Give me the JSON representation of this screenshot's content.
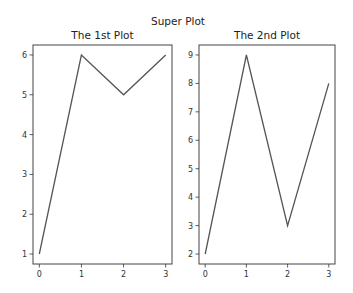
{
  "figure": {
    "suptitle": "Super Plot",
    "line_color": "#555555",
    "frame_color": "#444444"
  },
  "chart_data": [
    {
      "type": "line",
      "title": "The 1st Plot",
      "xlabel": "",
      "ylabel": "",
      "x": [
        0,
        1,
        2,
        3
      ],
      "values": [
        1,
        6,
        5,
        6
      ],
      "xticks": [
        "0",
        "1",
        "2",
        "3"
      ],
      "yticks": [
        "1",
        "2",
        "3",
        "4",
        "5",
        "6"
      ],
      "xlim": [
        -0.15,
        3.15
      ],
      "ylim": [
        0.75,
        6.25
      ],
      "grid": false,
      "legend": null
    },
    {
      "type": "line",
      "title": "The 2nd Plot",
      "xlabel": "",
      "ylabel": "",
      "x": [
        0,
        1,
        2,
        3
      ],
      "values": [
        2,
        9,
        3,
        8
      ],
      "xticks": [
        "0",
        "1",
        "2",
        "3"
      ],
      "yticks": [
        "2",
        "3",
        "4",
        "5",
        "6",
        "7",
        "8",
        "9"
      ],
      "xlim": [
        -0.15,
        3.15
      ],
      "ylim": [
        1.65,
        9.35
      ],
      "grid": false,
      "legend": null
    }
  ]
}
